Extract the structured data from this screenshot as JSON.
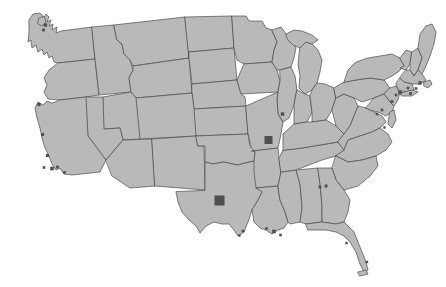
{
  "map": {
    "title": "United States Map with Highlighted Metropolitan Markers",
    "projection_note": "contiguous united states",
    "width": 446,
    "height": 287,
    "background_color": "#ffffff",
    "state_fill_color": "#b9b9b9",
    "state_border_color": "#4a4a4a",
    "state_border_width": 0.7,
    "marker_color": "#4f4f4f",
    "outer_border_color": "#3c3c3c"
  },
  "markers": [
    {
      "name": "st-louis-missouri",
      "label": "St. Louis",
      "x": 268.5,
      "y": 140.0,
      "size": 8.0,
      "shape": "square"
    },
    {
      "name": "dallas-fort-worth-texas",
      "label": "Dallas-Fort Worth",
      "x": 219.5,
      "y": 200.5,
      "size": 10.0,
      "shape": "square"
    },
    {
      "name": "chicago-illinois",
      "label": "Chicago",
      "x": 282.5,
      "y": 114.0,
      "size": 3.4,
      "shape": "square"
    },
    {
      "name": "san-francisco-bay-california",
      "label": "San Francisco Bay",
      "x": 39.0,
      "y": 104.5,
      "size": 3.2,
      "shape": "square"
    },
    {
      "name": "central-california",
      "label": "Central California",
      "x": 42.5,
      "y": 134.5,
      "size": 3.0,
      "shape": "square"
    },
    {
      "name": "bakersfield-california",
      "label": "Bakersfield",
      "x": 47.5,
      "y": 155.5,
      "size": 3.0,
      "shape": "square"
    },
    {
      "name": "los-angeles-california",
      "label": "Los Angeles",
      "x": 52.0,
      "y": 168.5,
      "size": 3.6,
      "shape": "square"
    },
    {
      "name": "los-angeles-east-california",
      "label": "Los Angeles East",
      "x": 57.5,
      "y": 167.0,
      "size": 2.8,
      "shape": "square"
    },
    {
      "name": "san-diego-california",
      "label": "San Diego",
      "x": 64.5,
      "y": 172.5,
      "size": 2.6,
      "shape": "square"
    },
    {
      "name": "santa-barbara-california",
      "label": "Santa Barbara",
      "x": 44.0,
      "y": 167.5,
      "size": 2.6,
      "shape": "square"
    },
    {
      "name": "seattle-puget-sound-washington",
      "label": "Seattle",
      "x": 45.5,
      "y": 25.0,
      "size": 3.4,
      "shape": "square"
    },
    {
      "name": "tacoma-washington",
      "label": "Tacoma",
      "x": 43.5,
      "y": 30.0,
      "size": 2.8,
      "shape": "square"
    },
    {
      "name": "boston-massachusetts",
      "label": "Boston",
      "x": 420.0,
      "y": 83.0,
      "size": 3.4,
      "shape": "square"
    },
    {
      "name": "providence-rhode-island",
      "label": "Providence",
      "x": 416.0,
      "y": 88.5,
      "size": 2.6,
      "shape": "square"
    },
    {
      "name": "hartford-connecticut",
      "label": "Hartford",
      "x": 408.0,
      "y": 88.0,
      "size": 2.6,
      "shape": "square"
    },
    {
      "name": "new-york-city-new-york",
      "label": "New York City",
      "x": 400.0,
      "y": 92.5,
      "size": 3.6,
      "shape": "square"
    },
    {
      "name": "long-island-new-york",
      "label": "Long Island",
      "x": 410.5,
      "y": 93.5,
      "size": 2.8,
      "shape": "square"
    },
    {
      "name": "newark-new-jersey",
      "label": "Newark",
      "x": 396.0,
      "y": 95.0,
      "size": 2.6,
      "shape": "square"
    },
    {
      "name": "philadelphia-pennsylvania",
      "label": "Philadelphia",
      "x": 392.0,
      "y": 101.5,
      "size": 2.8,
      "shape": "square"
    },
    {
      "name": "baltimore-maryland",
      "label": "Baltimore",
      "x": 382.0,
      "y": 110.0,
      "size": 2.6,
      "shape": "square"
    },
    {
      "name": "washington-dc",
      "label": "Washington D.C.",
      "x": 377.0,
      "y": 114.0,
      "size": 2.6,
      "shape": "square"
    },
    {
      "name": "norfolk-virginia",
      "label": "Norfolk",
      "x": 384.5,
      "y": 127.5,
      "size": 2.4,
      "shape": "square"
    },
    {
      "name": "atlanta-georgia",
      "label": "Atlanta",
      "x": 320.0,
      "y": 187.0,
      "size": 2.8,
      "shape": "square"
    },
    {
      "name": "atlanta-north-georgia",
      "label": "Atlanta North",
      "x": 326.0,
      "y": 186.0,
      "size": 3.0,
      "shape": "square"
    },
    {
      "name": "new-orleans-louisiana",
      "label": "New Orleans",
      "x": 274.0,
      "y": 231.5,
      "size": 3.6,
      "shape": "square"
    },
    {
      "name": "baton-rouge-louisiana",
      "label": "Baton Rouge",
      "x": 266.5,
      "y": 228.5,
      "size": 2.6,
      "shape": "square"
    },
    {
      "name": "mississippi-delta",
      "label": "Mississippi Delta",
      "x": 280.5,
      "y": 235.0,
      "size": 2.6,
      "shape": "square"
    },
    {
      "name": "houston-texas",
      "label": "Houston",
      "x": 243.0,
      "y": 231.0,
      "size": 2.6,
      "shape": "square"
    },
    {
      "name": "galveston-texas",
      "label": "Galveston",
      "x": 239.5,
      "y": 235.5,
      "size": 2.4,
      "shape": "square"
    },
    {
      "name": "tampa-florida",
      "label": "Tampa",
      "x": 346.5,
      "y": 243.0,
      "size": 2.4,
      "shape": "square"
    },
    {
      "name": "miami-florida",
      "label": "Miami",
      "x": 367.0,
      "y": 262.0,
      "size": 2.4,
      "shape": "square"
    }
  ]
}
